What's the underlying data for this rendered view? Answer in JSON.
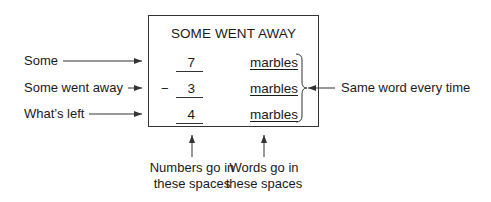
{
  "box": {
    "title": "SOME WENT AWAY",
    "operator": "−",
    "rows": [
      {
        "number": "7",
        "word": "marbles"
      },
      {
        "number": "3",
        "word": "marbles"
      },
      {
        "number": "4",
        "word": "marbles"
      }
    ]
  },
  "left_labels": [
    {
      "text": "Some"
    },
    {
      "text": "Some went away"
    },
    {
      "text": "What’s left"
    }
  ],
  "right_label": {
    "text": "Same word every time"
  },
  "bottom_labels": [
    {
      "line1": "Numbers go in",
      "line2": "these spaces"
    },
    {
      "line1": "Words go in",
      "line2": "these spaces"
    }
  ],
  "colors": {
    "stroke": "#333333",
    "text": "#1a1a1a",
    "background": "#ffffff"
  }
}
